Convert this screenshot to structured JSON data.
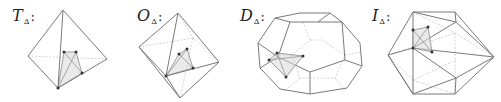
{
  "figures": [
    {
      "id": "tetrahedron",
      "letter": "T",
      "subscript": "Δ",
      "suffix": ":"
    },
    {
      "id": "octahedron",
      "letter": "O",
      "subscript": "Δ",
      "suffix": ":"
    },
    {
      "id": "dodecahedron",
      "letter": "D",
      "subscript": "Δ",
      "suffix": ":"
    },
    {
      "id": "icosahedron",
      "letter": "I",
      "subscript": "Δ",
      "suffix": ":"
    }
  ],
  "colors": {
    "edge": "#7a7a7a",
    "hidden_edge": "#c8c8c8",
    "simplex_fill": "#d9d9d9",
    "vertex": "#333333"
  }
}
